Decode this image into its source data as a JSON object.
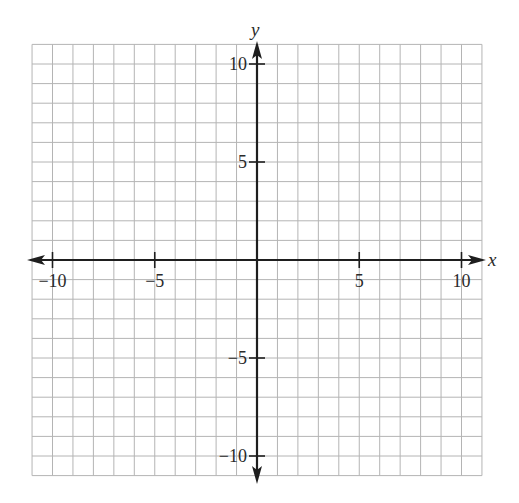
{
  "chart_data": {
    "type": "coordinate-grid",
    "title": "",
    "xlabel": "x",
    "ylabel": "y",
    "xlim": [
      -11,
      11
    ],
    "ylim": [
      -11,
      11
    ],
    "grid": true,
    "grid_step": 1,
    "x_ticks": [
      -10,
      -5,
      5,
      10
    ],
    "y_ticks": [
      -10,
      -5,
      5,
      10
    ],
    "x_tick_labels": [
      "−10",
      "−5",
      "5",
      "10"
    ],
    "y_tick_labels": [
      "−10",
      "−5",
      "5",
      "10"
    ],
    "series": [],
    "legend": null
  },
  "colors": {
    "grid": "#b4b4b4",
    "axis": "#1e1e1e",
    "background": "#ffffff"
  }
}
